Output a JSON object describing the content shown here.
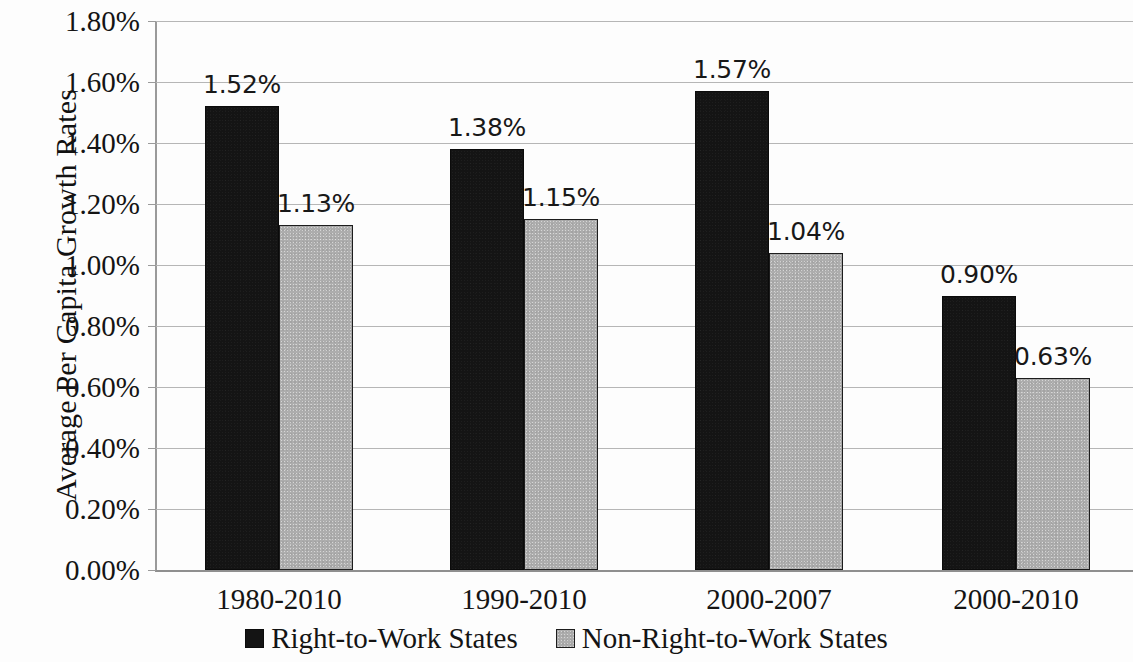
{
  "chart_data": {
    "type": "bar",
    "title": "",
    "xlabel": "",
    "ylabel": "Average Per Capita Growth Rates",
    "categories": [
      "1980-2010",
      "1990-2010",
      "2000-2007",
      "2000-2010"
    ],
    "series": [
      {
        "name": "Right-to-Work States",
        "color": "#141414",
        "values": [
          1.52,
          1.38,
          1.57,
          0.9
        ],
        "labels": [
          "1.52%",
          "1.38%",
          "1.57%",
          "0.90%"
        ]
      },
      {
        "name": "Non-Right-to-Work States",
        "color": "#adadad",
        "values": [
          1.13,
          1.15,
          1.04,
          0.63
        ],
        "labels": [
          "1.13%",
          "1.15%",
          "1.04%",
          "0.63%"
        ]
      }
    ],
    "ylim": [
      0,
      1.8
    ],
    "ytick_values": [
      1.8,
      1.6,
      1.4,
      1.2,
      1.0,
      0.8,
      0.6,
      0.4,
      0.2,
      0.0
    ],
    "ytick_labels": [
      "1.80%",
      "1.60%",
      "1.40%",
      "1.20%",
      "1.00%",
      "0.80%",
      "0.60%",
      "0.40%",
      "0.20%",
      "0.00%"
    ],
    "grid": true,
    "legend_position": "bottom"
  },
  "legend": {
    "items": [
      {
        "label": "Right-to-Work States",
        "swatch": "black-square-icon"
      },
      {
        "label": "Non-Right-to-Work States",
        "swatch": "gray-square-icon"
      }
    ]
  }
}
